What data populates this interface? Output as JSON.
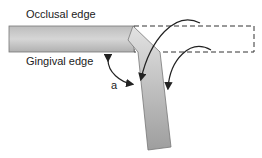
{
  "diagram": {
    "labels": {
      "occlusal": "Occlusal edge",
      "gingival": "Gingival edge",
      "angle": "a"
    },
    "colors": {
      "band_light": "#d8d8d8",
      "band_dark": "#a6a6a6",
      "stroke": "#666666",
      "arrow": "#222222",
      "dashed": "#333333"
    }
  }
}
